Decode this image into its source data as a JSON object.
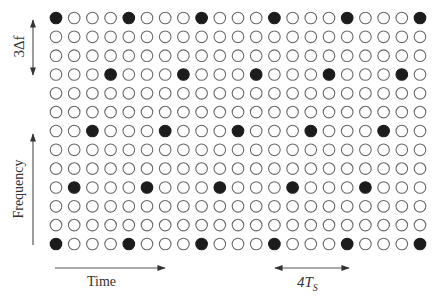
{
  "diagram": {
    "type": "time-frequency pilot grid",
    "grid": {
      "rows": 13,
      "cols": 21,
      "origin_x": 56,
      "origin_y": 18,
      "step_x": 18.2,
      "step_y": 18.83,
      "radius": 5.8,
      "filled_rule": "row index r (top=0) divisible by 3; filled at column c where (c + r/3) mod 4 == 0",
      "filled_rows": [
        {
          "row": 0,
          "cols": [
            0,
            4,
            8,
            12,
            16,
            20
          ]
        },
        {
          "row": 3,
          "cols": [
            3,
            7,
            11,
            15,
            19
          ]
        },
        {
          "row": 6,
          "cols": [
            2,
            6,
            10,
            14,
            18
          ]
        },
        {
          "row": 9,
          "cols": [
            1,
            5,
            9,
            13,
            17
          ]
        },
        {
          "row": 12,
          "cols": [
            0,
            4,
            8,
            12,
            16,
            20
          ]
        }
      ]
    },
    "colors": {
      "filled": "#1c1c1c",
      "outline": "#6a6a6a",
      "arrow": "#444444",
      "text": "#333333"
    },
    "labels": {
      "freq_spacing": "3Δf",
      "frequency_axis": "Frequency",
      "time_axis": "Time",
      "time_spacing_main": "4T",
      "time_spacing_sub": "S"
    }
  }
}
